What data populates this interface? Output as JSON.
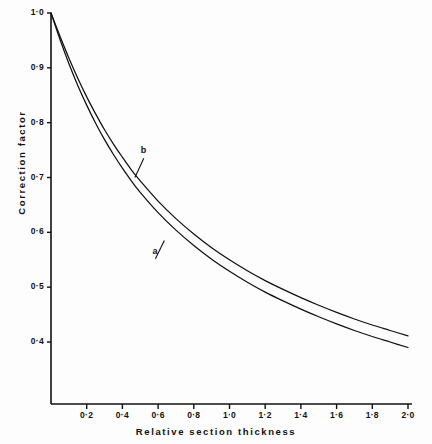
{
  "chart_data": {
    "type": "line",
    "title": "",
    "subtitle": "",
    "xlabel": "Relative section thickness",
    "ylabel": "Correction factor",
    "xlim": [
      0,
      2.0
    ],
    "ylim": [
      0.33,
      1.0
    ],
    "grid": false,
    "legend_position": "inline-annotations",
    "xticks": [
      0.2,
      0.4,
      0.6,
      0.8,
      1.0,
      1.2,
      1.4,
      1.6,
      1.8,
      2.0
    ],
    "xtick_labels": [
      "0·2",
      "0·4",
      "0·6",
      "0·8",
      "1·0",
      "1·2",
      "1·4",
      "1·6",
      "1·8",
      "2·0"
    ],
    "yticks": [
      0.4,
      0.5,
      0.6,
      0.7,
      0.8,
      0.9,
      1.0
    ],
    "ytick_labels": [
      "0·4",
      "0·5",
      "0·6",
      "0·7",
      "0·8",
      "0·9",
      "1·0"
    ],
    "annotations": [
      {
        "text": "b",
        "x": 0.52,
        "y": 0.735,
        "points_to_x": 0.47,
        "points_to_y": 0.7
      },
      {
        "text": "a",
        "x": 0.585,
        "y": 0.552,
        "points_to_x": 0.635,
        "points_to_y": 0.585
      }
    ],
    "series": [
      {
        "name": "a",
        "label": "a",
        "color": "#111111",
        "x": [
          0.0,
          0.05,
          0.1,
          0.15,
          0.2,
          0.25,
          0.3,
          0.35,
          0.4,
          0.45,
          0.5,
          0.6,
          0.7,
          0.8,
          0.9,
          1.0,
          1.1,
          1.2,
          1.3,
          1.4,
          1.5,
          1.6,
          1.7,
          1.8,
          1.9,
          2.0
        ],
        "values": [
          1.0,
          0.952,
          0.908,
          0.868,
          0.832,
          0.799,
          0.769,
          0.742,
          0.717,
          0.694,
          0.673,
          0.636,
          0.604,
          0.576,
          0.551,
          0.529,
          0.509,
          0.491,
          0.475,
          0.46,
          0.446,
          0.433,
          0.421,
          0.41,
          0.4,
          0.39
        ]
      },
      {
        "name": "b",
        "label": "b",
        "color": "#111111",
        "x": [
          0.0,
          0.05,
          0.1,
          0.15,
          0.2,
          0.25,
          0.3,
          0.35,
          0.4,
          0.45,
          0.5,
          0.6,
          0.7,
          0.8,
          0.9,
          1.0,
          1.1,
          1.2,
          1.3,
          1.4,
          1.5,
          1.6,
          1.7,
          1.8,
          1.9,
          2.0
        ],
        "values": [
          1.0,
          0.958,
          0.918,
          0.881,
          0.847,
          0.816,
          0.787,
          0.761,
          0.737,
          0.714,
          0.694,
          0.657,
          0.625,
          0.597,
          0.572,
          0.55,
          0.53,
          0.512,
          0.496,
          0.481,
          0.467,
          0.454,
          0.442,
          0.431,
          0.421,
          0.411
        ]
      }
    ]
  },
  "axes": {
    "x_title": "Relative section thickness",
    "y_title": "Correction factor"
  }
}
